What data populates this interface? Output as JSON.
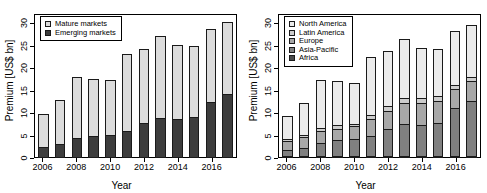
{
  "figure": {
    "panels": [
      {
        "id": "left",
        "ylabel": "Premium [US$ bn]",
        "xlabel": "Year"
      },
      {
        "id": "right",
        "ylabel": "Premium [US$ bn]",
        "xlabel": "Year"
      }
    ]
  },
  "chart_data": [
    {
      "type": "bar",
      "stacked": true,
      "id": "left-panel",
      "title": "",
      "xlabel": "Year",
      "ylabel": "Premium [US$ bn]",
      "ylim": [
        0,
        32
      ],
      "yticks": [
        0,
        5,
        10,
        15,
        20,
        25,
        30
      ],
      "ytick_labels": [
        "0",
        "5",
        "10",
        "15",
        "20",
        "25",
        "30"
      ],
      "grid": false,
      "legend_position": "top-left",
      "categories": [
        2006,
        2007,
        2008,
        2009,
        2010,
        2011,
        2012,
        2013,
        2014,
        2015,
        2016,
        2017
      ],
      "xtick_labels": [
        "2006",
        "2008",
        "2010",
        "2012",
        "2014",
        "2016"
      ],
      "xtick_categories": [
        2006,
        2008,
        2010,
        2012,
        2014,
        2016
      ],
      "series": [
        {
          "name": "Emerging markets",
          "color": "#3d3d3d",
          "values": [
            2.5,
            3.1,
            4.4,
            4.9,
            5.2,
            6.2,
            7.8,
            9.0,
            8.8,
            9.3,
            12.7,
            14.4
          ]
        },
        {
          "name": "Mature markets",
          "color": "#dcdcdc",
          "values": [
            7.7,
            10.1,
            14.1,
            13.2,
            12.5,
            17.5,
            17.1,
            18.7,
            16.9,
            16.2,
            16.7,
            16.5
          ]
        }
      ],
      "totals": [
        10.2,
        13.2,
        18.5,
        18.1,
        17.7,
        23.7,
        24.9,
        27.7,
        25.7,
        25.5,
        29.4,
        30.9
      ],
      "stack_order_bottom_to_top": [
        "Emerging markets",
        "Mature markets"
      ],
      "legend_order": [
        "Mature markets",
        "Emerging markets"
      ]
    },
    {
      "type": "bar",
      "stacked": true,
      "id": "right-panel",
      "title": "",
      "xlabel": "Year",
      "ylabel": "Premium [US$ bn]",
      "ylim": [
        0,
        32
      ],
      "yticks": [
        0,
        5,
        10,
        15,
        20,
        25,
        30
      ],
      "ytick_labels": [
        "0",
        "5",
        "10",
        "15",
        "20",
        "25",
        "30"
      ],
      "grid": false,
      "legend_position": "top-left",
      "categories": [
        2006,
        2007,
        2008,
        2009,
        2010,
        2011,
        2012,
        2013,
        2014,
        2015,
        2016,
        2017
      ],
      "xtick_labels": [
        "2006",
        "2008",
        "2010",
        "2012",
        "2014",
        "2016"
      ],
      "xtick_categories": [
        2006,
        2008,
        2010,
        2012,
        2014,
        2016
      ],
      "series": [
        {
          "name": "Africa",
          "color": "#4a4a4a",
          "values": [
            0.3,
            0.4,
            0.4,
            0.4,
            0.4,
            0.4,
            0.4,
            0.4,
            0.4,
            0.4,
            0.4,
            0.4
          ]
        },
        {
          "name": "Asia-Pacific",
          "color": "#808080",
          "values": [
            1.5,
            2.0,
            3.2,
            3.8,
            4.1,
            4.8,
            6.3,
            7.4,
            7.2,
            7.6,
            11.1,
            12.6
          ]
        },
        {
          "name": "Europe",
          "color": "#a8a8a8",
          "values": [
            2.4,
            2.7,
            2.8,
            2.8,
            3.1,
            4.1,
            4.4,
            4.9,
            5.2,
            5.3,
            4.4,
            4.7
          ]
        },
        {
          "name": "Latin America",
          "color": "#cccccc",
          "values": [
            0.6,
            0.7,
            1.0,
            1.0,
            0.8,
            1.1,
            1.2,
            1.4,
            1.3,
            1.2,
            1.1,
            1.1
          ]
        },
        {
          "name": "North America",
          "color": "#ebebeb",
          "values": [
            5.4,
            7.4,
            11.1,
            10.1,
            9.3,
            13.3,
            12.6,
            13.6,
            11.6,
            11.0,
            12.4,
            12.1
          ]
        }
      ],
      "totals": [
        10.2,
        13.2,
        18.5,
        18.1,
        17.7,
        23.7,
        24.9,
        27.7,
        25.7,
        25.5,
        29.4,
        30.9
      ],
      "stack_order_bottom_to_top": [
        "Africa",
        "Asia-Pacific",
        "Europe",
        "Latin America",
        "North America"
      ],
      "legend_order": [
        "North America",
        "Latin America",
        "Europe",
        "Asia-Pacific",
        "Africa"
      ]
    }
  ]
}
